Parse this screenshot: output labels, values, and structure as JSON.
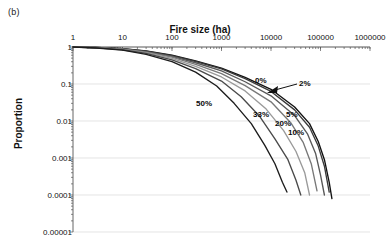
{
  "panel": {
    "label": "(b)"
  },
  "axes": {
    "x_title": "Fire size (ha)",
    "y_title": "Proportion",
    "x_ticks": [
      "1",
      "10",
      "100",
      "1000",
      "10000",
      "100000",
      "1000000"
    ],
    "y_ticks": [
      "1",
      "0.1",
      "0.01",
      "0.001",
      "0.0001",
      "0.00001"
    ]
  },
  "annotations": {
    "pct_0": "0%",
    "pct_2": "2%",
    "pct_5": "5%",
    "pct_10": "10%",
    "pct_20": "20%",
    "pct_33": "33%",
    "pct_50": "50%"
  },
  "chart_data": {
    "type": "line",
    "title": "",
    "xlabel": "Fire size (ha)",
    "ylabel": "Proportion",
    "xscale": "log",
    "yscale": "log",
    "xlim": [
      1,
      1000000
    ],
    "ylim": [
      1e-05,
      1
    ],
    "grid": true,
    "legend_position": "inline-annotations",
    "series": [
      {
        "name": "0%",
        "color": "#111111",
        "x": [
          1,
          3,
          10,
          30,
          100,
          300,
          1000,
          3000,
          10000,
          30000,
          60000,
          90000,
          120000,
          150000,
          170000
        ],
        "y": [
          1.0,
          0.97,
          0.9,
          0.78,
          0.6,
          0.42,
          0.27,
          0.15,
          0.072,
          0.024,
          0.0085,
          0.0028,
          0.0009,
          0.00022,
          8e-05
        ]
      },
      {
        "name": "2%",
        "color": "#3a3a3a",
        "x": [
          1,
          3,
          10,
          30,
          100,
          300,
          1000,
          3000,
          10000,
          30000,
          60000,
          90000,
          120000,
          150000
        ],
        "y": [
          1.0,
          0.97,
          0.895,
          0.77,
          0.585,
          0.405,
          0.255,
          0.14,
          0.063,
          0.02,
          0.0068,
          0.0021,
          0.0006,
          0.00012
        ]
      },
      {
        "name": "5%",
        "color": "#585858",
        "x": [
          1,
          3,
          10,
          30,
          100,
          300,
          1000,
          3000,
          10000,
          30000,
          55000,
          80000,
          100000,
          120000
        ],
        "y": [
          1.0,
          0.965,
          0.885,
          0.75,
          0.56,
          0.375,
          0.225,
          0.115,
          0.048,
          0.014,
          0.0044,
          0.0013,
          0.00035,
          0.0001
        ]
      },
      {
        "name": "10%",
        "color": "#787878",
        "x": [
          1,
          3,
          10,
          30,
          100,
          300,
          1000,
          3000,
          10000,
          25000,
          45000,
          65000,
          85000
        ],
        "y": [
          1.0,
          0.96,
          0.875,
          0.73,
          0.53,
          0.34,
          0.19,
          0.09,
          0.033,
          0.009,
          0.0026,
          0.0007,
          0.00013
        ]
      },
      {
        "name": "20%",
        "color": "#9a9a9a",
        "x": [
          1,
          3,
          10,
          30,
          100,
          300,
          1000,
          3000,
          8000,
          18000,
          32000,
          48000,
          60000
        ],
        "y": [
          1.0,
          0.955,
          0.86,
          0.705,
          0.49,
          0.3,
          0.155,
          0.065,
          0.021,
          0.0055,
          0.0015,
          0.0004,
          0.0001
        ]
      },
      {
        "name": "33%",
        "color": "#4a4a4a",
        "x": [
          1,
          3,
          10,
          30,
          100,
          300,
          1000,
          2500,
          6000,
          12000,
          22000,
          32000,
          40000
        ],
        "y": [
          1.0,
          0.95,
          0.845,
          0.675,
          0.45,
          0.26,
          0.12,
          0.045,
          0.013,
          0.0033,
          0.0009,
          0.00025,
          0.0001
        ]
      },
      {
        "name": "50%",
        "color": "#1c1c1c",
        "x": [
          1,
          3,
          10,
          30,
          100,
          300,
          800,
          1800,
          4000,
          7500,
          12000,
          17000,
          21000
        ],
        "y": [
          1.0,
          0.94,
          0.82,
          0.63,
          0.4,
          0.21,
          0.088,
          0.03,
          0.0085,
          0.0022,
          0.0007,
          0.00022,
          0.00012
        ]
      }
    ]
  }
}
